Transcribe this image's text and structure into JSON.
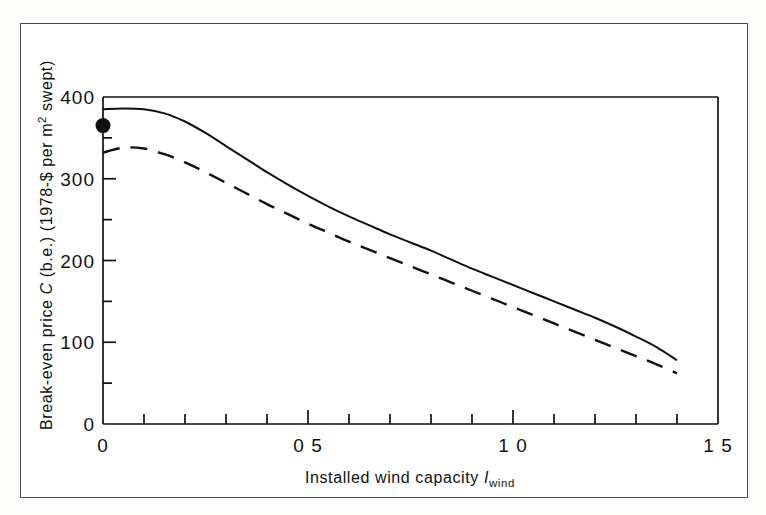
{
  "figure": {
    "background_color": "#ffffff",
    "frame_color": "#4a4a4a",
    "ink_color": "#111111"
  },
  "axis_titles": {
    "y_full": "Break-even price C (b.e.) (1978-$ per m2 swept)",
    "y_part_1": "Break-even price ",
    "y_symbol": "C",
    "y_part_2": " (b.e.) (1978-$ per m",
    "y_exponent": "2",
    "y_part_3": " swept)",
    "x_full": "Installed wind capacity Iwind",
    "x_part_1": "Installed  wind  capacity  ",
    "x_symbol": "I",
    "x_subscript": "wind"
  },
  "y_ticks": {
    "major_labels": [
      "400",
      "300",
      "200",
      "100",
      "0"
    ],
    "major_values": [
      400,
      300,
      200,
      100,
      0
    ],
    "minor_values": [
      350,
      250,
      150,
      50
    ]
  },
  "x_ticks": {
    "major_labels": [
      "0",
      "0 5",
      "1 0",
      "1 5"
    ],
    "major_values": [
      0,
      0.5,
      1.0,
      1.5
    ],
    "minor_values": [
      0.1,
      0.2,
      0.3,
      0.4,
      0.6,
      0.7,
      0.8,
      0.9,
      1.1,
      1.2,
      1.3,
      1.4
    ]
  },
  "chart_data": {
    "type": "line",
    "title": "",
    "subtitle": "",
    "xlabel": "Installed wind capacity I_wind",
    "ylabel": "Break-even price C (b.e.) (1978-$ per m^2 swept)",
    "xlim": [
      0,
      1.5
    ],
    "ylim": [
      0,
      400
    ],
    "grid": false,
    "legend": "none",
    "x_tick_labels": [
      "0",
      "0·5",
      "1·0",
      "1·5"
    ],
    "x_tick_values": [
      0,
      0.5,
      1.0,
      1.5
    ],
    "y_tick_labels": [
      "0",
      "100",
      "200",
      "300",
      "400"
    ],
    "y_tick_values": [
      0,
      100,
      200,
      300,
      400
    ],
    "x_minor_step": 0.1,
    "y_minor_step": 50,
    "series": [
      {
        "name": "solid-curve",
        "style": "solid",
        "color": "#111111",
        "x": [
          0.0,
          0.05,
          0.1,
          0.15,
          0.2,
          0.25,
          0.3,
          0.35,
          0.4,
          0.45,
          0.5,
          0.55,
          0.6,
          0.65,
          0.7,
          0.75,
          0.8,
          0.85,
          0.9,
          0.95,
          1.0,
          1.05,
          1.1,
          1.15,
          1.2,
          1.25,
          1.3,
          1.35,
          1.4
        ],
        "y": [
          385,
          386,
          385,
          380,
          370,
          356,
          340,
          324,
          308,
          293,
          279,
          266,
          254,
          243,
          232,
          222,
          212,
          201,
          190,
          180,
          170,
          160,
          150,
          140,
          130,
          119,
          107,
          94,
          78
        ]
      },
      {
        "name": "dashed-curve",
        "style": "dashed",
        "color": "#111111",
        "x": [
          0.0,
          0.05,
          0.1,
          0.15,
          0.2,
          0.25,
          0.3,
          0.35,
          0.4,
          0.45,
          0.5,
          0.55,
          0.6,
          0.65,
          0.7,
          0.75,
          0.8,
          0.85,
          0.9,
          0.95,
          1.0,
          1.05,
          1.1,
          1.15,
          1.2,
          1.25,
          1.3,
          1.35,
          1.4
        ],
        "y": [
          332,
          338,
          337,
          330,
          320,
          308,
          295,
          282,
          269,
          257,
          245,
          234,
          223,
          213,
          203,
          193,
          183,
          173,
          163,
          153,
          143,
          133,
          123,
          113,
          103,
          93,
          83,
          73,
          62
        ]
      }
    ],
    "markers": [
      {
        "name": "break-even-point",
        "shape": "filled-circle",
        "x": 0.0,
        "y": 365,
        "color": "#111111"
      }
    ]
  }
}
